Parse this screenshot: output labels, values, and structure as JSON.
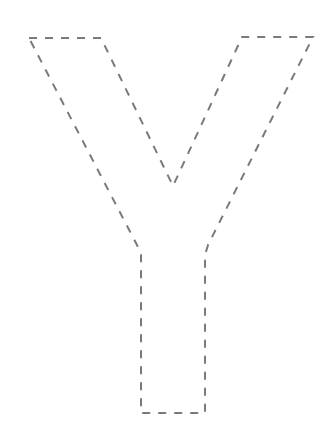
{
  "figure": {
    "letter": "Y",
    "style": "dashed-outline",
    "stroke_color": "#7a7a7a",
    "background": "#ffffff",
    "dash_pattern": "8 8",
    "outline_points": [
      [
        29,
        38
      ],
      [
        101,
        38
      ],
      [
        173,
        186
      ],
      [
        242,
        37
      ],
      [
        313,
        37
      ],
      [
        208,
        245
      ],
      [
        205,
        255
      ],
      [
        205,
        413
      ],
      [
        141,
        413
      ],
      [
        141,
        255
      ],
      [
        137,
        245
      ],
      [
        29,
        38
      ]
    ]
  }
}
